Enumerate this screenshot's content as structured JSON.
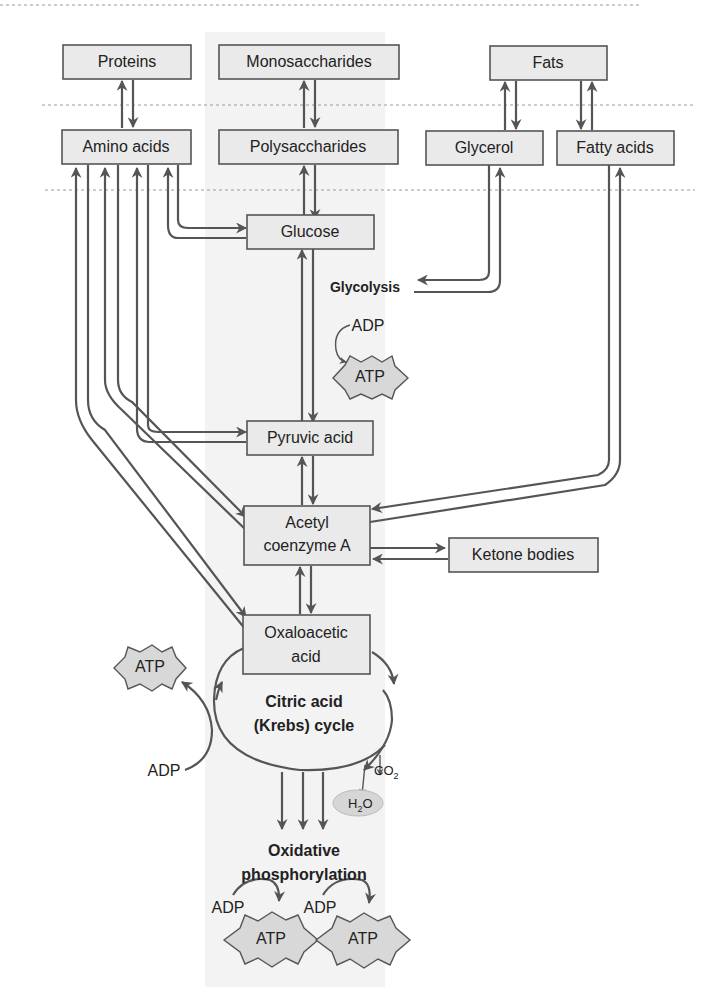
{
  "accent_colors": {
    "box_fill": "#eaeaea",
    "stroke": "#555555",
    "band": "#f3f3f3"
  },
  "nodes": {
    "proteins": "Proteins",
    "monosaccharides": "Monosaccharides",
    "fats": "Fats",
    "amino_acids": "Amino acids",
    "polysaccharides": "Polysaccharides",
    "glycerol": "Glycerol",
    "fatty_acids": "Fatty acids",
    "glucose": "Glucose",
    "pyruvic_acid": "Pyruvic acid",
    "acetyl_line1": "Acetyl",
    "acetyl_line2": "coenzyme A",
    "ketone_bodies": "Ketone bodies",
    "oxalo_line1": "Oxaloacetic",
    "oxalo_line2": "acid"
  },
  "labels": {
    "glycolysis": "Glycolysis",
    "krebs_line1": "Citric acid",
    "krebs_line2": "(Krebs) cycle",
    "oxphos_line1": "Oxidative",
    "oxphos_line2": "phosphorylation",
    "adp": "ADP",
    "atp": "ATP",
    "co2": "CO",
    "co2_sub": "2",
    "h2o_h": "H",
    "h2o_sub": "2",
    "h2o_o": "O"
  }
}
